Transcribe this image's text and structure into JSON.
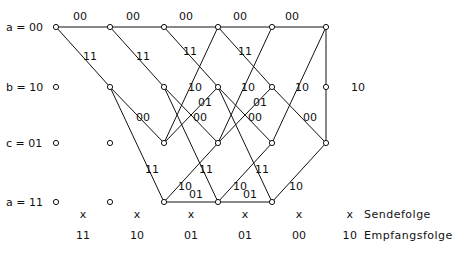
{
  "diagram": {
    "type": "trellis",
    "columns_x": [
      56,
      110,
      164,
      218,
      272,
      326
    ],
    "rows": [
      {
        "id": "a",
        "label": "a = 00",
        "y": 27
      },
      {
        "id": "b",
        "label": "b = 10",
        "y": 87
      },
      {
        "id": "c",
        "label": "c = 01",
        "y": 143
      },
      {
        "id": "d",
        "label": "a = 11",
        "y": 202
      }
    ],
    "edges": [
      {
        "from": [
          "a",
          0
        ],
        "to": [
          "a",
          1
        ],
        "label": "00",
        "lx": 80,
        "ly": 20
      },
      {
        "from": [
          "a",
          1
        ],
        "to": [
          "a",
          2
        ],
        "label": "00",
        "lx": 133,
        "ly": 20
      },
      {
        "from": [
          "a",
          2
        ],
        "to": [
          "a",
          3
        ],
        "label": "00",
        "lx": 186,
        "ly": 20
      },
      {
        "from": [
          "a",
          3
        ],
        "to": [
          "a",
          4
        ],
        "label": "00",
        "lx": 240,
        "ly": 20
      },
      {
        "from": [
          "a",
          4
        ],
        "to": [
          "a",
          5
        ],
        "label": "00",
        "lx": 292,
        "ly": 20
      },
      {
        "from": [
          "a",
          5
        ],
        "to": [
          "a",
          6
        ],
        "label": "00",
        "lx": 345,
        "ly": 20
      },
      {
        "from": [
          "a",
          0
        ],
        "to": [
          "b",
          1
        ],
        "label": "11",
        "lx": 90,
        "ly": 60
      },
      {
        "from": [
          "a",
          1
        ],
        "to": [
          "b",
          2
        ],
        "label": "11",
        "lx": 143,
        "ly": 60
      },
      {
        "from": [
          "a",
          2
        ],
        "to": [
          "b",
          3
        ],
        "label": "11",
        "lx": 190,
        "ly": 55
      },
      {
        "from": [
          "a",
          3
        ],
        "to": [
          "b",
          4
        ],
        "label": "11",
        "lx": 245,
        "ly": 55
      },
      {
        "from": [
          "b",
          1
        ],
        "to": [
          "c",
          2
        ],
        "label": "00",
        "lx": 143,
        "ly": 121
      },
      {
        "from": [
          "b",
          2
        ],
        "to": [
          "c",
          3
        ],
        "label": "00",
        "lx": 200,
        "ly": 121
      },
      {
        "from": [
          "b",
          3
        ],
        "to": [
          "c",
          4
        ],
        "label": "00",
        "lx": 255,
        "ly": 121
      },
      {
        "from": [
          "b",
          4
        ],
        "to": [
          "c",
          5
        ],
        "label": "00",
        "lx": 310,
        "ly": 121
      },
      {
        "from": [
          "b",
          1
        ],
        "to": [
          "d",
          2
        ],
        "label": "11",
        "lx": 152,
        "ly": 173
      },
      {
        "from": [
          "b",
          2
        ],
        "to": [
          "d",
          3
        ],
        "label": "11",
        "lx": 206,
        "ly": 173
      },
      {
        "from": [
          "b",
          3
        ],
        "to": [
          "d",
          4
        ],
        "label": "11",
        "lx": 262,
        "ly": 173
      },
      {
        "from": [
          "c",
          2
        ],
        "to": [
          "a",
          3
        ],
        "label": "10",
        "lx": 195,
        "ly": 91
      },
      {
        "from": [
          "c",
          3
        ],
        "to": [
          "a",
          4
        ],
        "label": "10",
        "lx": 248,
        "ly": 91
      },
      {
        "from": [
          "c",
          4
        ],
        "to": [
          "a",
          5
        ],
        "label": "10",
        "lx": 302,
        "ly": 91
      },
      {
        "from": [
          "c",
          5
        ],
        "to": [
          "a",
          6
        ],
        "label": "10",
        "lx": 358,
        "ly": 91
      },
      {
        "from": [
          "c",
          2
        ],
        "to": [
          "b",
          3
        ],
        "label": "01",
        "lx": 205,
        "ly": 106
      },
      {
        "from": [
          "c",
          3
        ],
        "to": [
          "b",
          4
        ],
        "label": "01",
        "lx": 260,
        "ly": 106
      },
      {
        "from": [
          "d",
          2
        ],
        "to": [
          "c",
          3
        ],
        "label": "10",
        "lx": 185,
        "ly": 190
      },
      {
        "from": [
          "d",
          3
        ],
        "to": [
          "c",
          4
        ],
        "label": "10",
        "lx": 240,
        "ly": 190
      },
      {
        "from": [
          "d",
          4
        ],
        "to": [
          "c",
          5
        ],
        "label": "10",
        "lx": 296,
        "ly": 190
      },
      {
        "from": [
          "d",
          2
        ],
        "to": [
          "d",
          3
        ],
        "label": "01",
        "lx": 196,
        "ly": 198
      },
      {
        "from": [
          "d",
          3
        ],
        "to": [
          "d",
          4
        ],
        "label": "01",
        "lx": 250,
        "ly": 198
      }
    ],
    "empty_nodes": [
      [
        "b",
        0
      ],
      [
        "c",
        0
      ],
      [
        "c",
        1
      ],
      [
        "d",
        0
      ],
      [
        "d",
        1
      ],
      [
        "b",
        5
      ]
    ],
    "sendefolge": {
      "marks": [
        "x",
        "x",
        "x",
        "x",
        "x"
      ],
      "label": "Sendefolge",
      "legend_mark": "x"
    },
    "empfangsfolge": {
      "values": [
        "11",
        "10",
        "01",
        "01",
        "00"
      ],
      "label": "Empfangsfolge",
      "legend_value": "10"
    }
  }
}
